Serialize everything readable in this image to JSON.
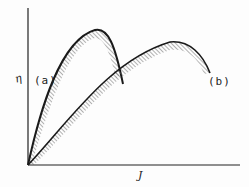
{
  "figure": {
    "y_axis_label": "η",
    "x_axis_label": "J",
    "curves": [
      {
        "id": "a",
        "label": "(a)"
      },
      {
        "id": "b",
        "label": "(b)"
      }
    ],
    "colors": {
      "line": "#1a1a1a",
      "hatch": "#555555",
      "background": "#fdfdfd"
    }
  }
}
